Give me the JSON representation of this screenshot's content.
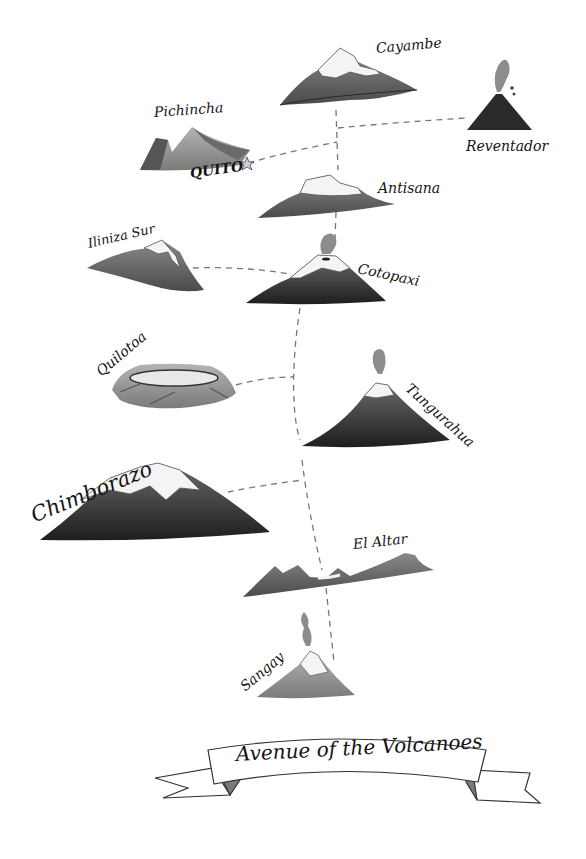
{
  "title": "Avenue of the Volcanoes",
  "city": {
    "name": "QUITO",
    "icon": "star-icon"
  },
  "volcanoes": [
    {
      "name": "Cayambe",
      "cap": "snow"
    },
    {
      "name": "Reventador",
      "cap": "erupting"
    },
    {
      "name": "Pichincha",
      "cap": "none"
    },
    {
      "name": "Antisana",
      "cap": "snow"
    },
    {
      "name": "Iliniza Sur",
      "cap": "snow"
    },
    {
      "name": "Cotopaxi",
      "cap": "snow, plume"
    },
    {
      "name": "Quilotoa",
      "cap": "crater lake"
    },
    {
      "name": "Tungurahua",
      "cap": "snow, plume"
    },
    {
      "name": "Chimborazo",
      "cap": "snow"
    },
    {
      "name": "El Altar",
      "cap": "snow"
    },
    {
      "name": "Sangay",
      "cap": "snow, plume"
    }
  ],
  "colors": {
    "ink": "#141414",
    "dark": "#2e2e2e",
    "mid": "#5e5e5e",
    "light": "#9a9a9a",
    "snow": "#f4f4f4",
    "route": "#777777"
  }
}
